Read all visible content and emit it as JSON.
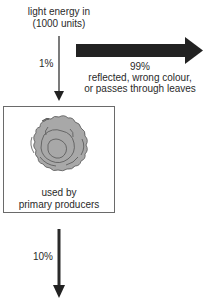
{
  "diagram": {
    "input": {
      "line1": "light energy in",
      "line2": "(1000 units)"
    },
    "loss_arrow": {
      "percent": "99%",
      "line1": "reflected, wrong colour,",
      "line2": "or passes through leaves"
    },
    "to_producers_arrow": {
      "percent": "1%"
    },
    "producers_box": {
      "icon": "lettuce-icon",
      "line1": "used by",
      "line2": "primary producers"
    },
    "next_level_arrow": {
      "percent": "10%"
    },
    "colors": {
      "arrow": "#2a2a2a",
      "box_border": "#6a6a6a",
      "lettuce_fill": "#a8a8a8",
      "lettuce_stroke": "#555555"
    }
  }
}
